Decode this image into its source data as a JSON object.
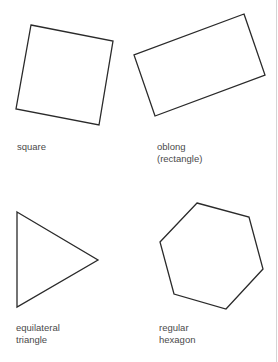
{
  "shapes": [
    {
      "id": "square",
      "label_lines": [
        "square"
      ],
      "points": [
        [
          31,
          25
        ],
        [
          113,
          41
        ],
        [
          99,
          125
        ],
        [
          16,
          109
        ]
      ],
      "label_pos": [
        17,
        141
      ]
    },
    {
      "id": "oblong",
      "label_lines": [
        "oblong",
        "(rectangle)"
      ],
      "points": [
        [
          244,
          14
        ],
        [
          265,
          75
        ],
        [
          155,
          116
        ],
        [
          134,
          55
        ]
      ],
      "label_pos": [
        157,
        141
      ]
    },
    {
      "id": "equilateral-triangle",
      "label_lines": [
        "equilateral",
        "triangle"
      ],
      "points": [
        [
          17,
          212
        ],
        [
          98,
          260
        ],
        [
          17,
          307
        ]
      ],
      "label_pos": [
        16,
        322
      ]
    },
    {
      "id": "regular-hexagon",
      "label_lines": [
        "regular",
        "hexagon"
      ],
      "points": [
        [
          197,
          203
        ],
        [
          249,
          217
        ],
        [
          263,
          269
        ],
        [
          226,
          309
        ],
        [
          174,
          294
        ],
        [
          160,
          242
        ]
      ],
      "label_pos": [
        159,
        322
      ]
    }
  ],
  "style": {
    "stroke": "#2a2a2a",
    "stroke_width": 1.3,
    "label_color": "#4a4a4a"
  }
}
